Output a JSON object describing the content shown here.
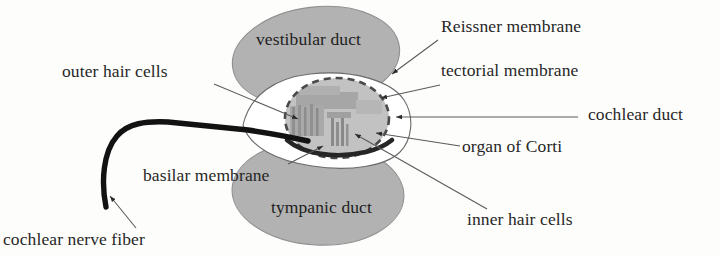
{
  "figure": {
    "background_color": "#fdfdfc"
  },
  "colors": {
    "duct_fill": "#b2b2b2",
    "duct_stroke": "#8e8e8e",
    "cochlear_duct_fill": "#ffffff",
    "cochlear_duct_stroke": "#5a5a5a",
    "organ_fill": "#b4b4b4",
    "organ_stroke": "#4a4a4a",
    "basilar_membrane": "#2a2a2a",
    "nerve_fiber": "#111111",
    "leader_line": "#5b5b5b",
    "text": "#272727"
  },
  "structures": [
    {
      "name": "vestibular-duct",
      "label": "vestibular duct",
      "shape": "ellipse",
      "label_position": "inside"
    },
    {
      "name": "tympanic-duct",
      "label": "tympanic duct",
      "shape": "ellipse",
      "label_position": "inside"
    },
    {
      "name": "cochlear-duct",
      "label": "cochlear duct",
      "shape": "lens",
      "label_position": "right"
    },
    {
      "name": "organ-of-corti",
      "label": "organ of Corti",
      "shape": "dashed-oval",
      "label_position": "right"
    }
  ],
  "labels": {
    "outer_hair_cells": "outer hair cells",
    "vestibular_duct": "vestibular duct",
    "reissner_membrane": "Reissner membrane",
    "tectorial_membrane": "tectorial membrane",
    "cochlear_duct": "cochlear duct",
    "organ_of_corti": "organ of Corti",
    "basilar_membrane": "basilar membrane",
    "tympanic_duct": "tympanic duct",
    "inner_hair_cells": "inner hair cells",
    "cochlear_nerve_fiber": "cochlear nerve fiber"
  }
}
